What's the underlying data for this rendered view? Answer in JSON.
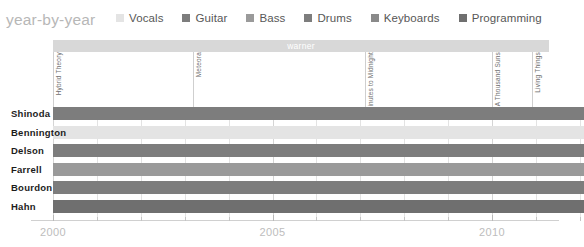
{
  "header": {
    "title": "year-by-year",
    "legend": [
      {
        "label": "Vocals",
        "color": "#e4e4e4"
      },
      {
        "label": "Guitar",
        "color": "#7d7d7d"
      },
      {
        "label": "Bass",
        "color": "#9a9a9a"
      },
      {
        "label": "Drums",
        "color": "#7d7d7d"
      },
      {
        "label": "Keyboards",
        "color": "#8a8a8a"
      },
      {
        "label": "Programming",
        "color": "#6f6f6f"
      }
    ]
  },
  "era": {
    "label": "warner",
    "color": "#d8d8d8",
    "start_year": 2000.0,
    "end_year": 2011.3
  },
  "albums": [
    {
      "label": "Hybrid Theory",
      "year": 2000.0
    },
    {
      "label": "Meteora",
      "year": 2003.2
    },
    {
      "label": "Minutes to Midnight",
      "year": 2007.1
    },
    {
      "label": "A Thousand Suns",
      "year": 2010.0
    },
    {
      "label": "Living Things",
      "year": 2010.9
    }
  ],
  "xaxis": {
    "ticks": [
      {
        "label": "2000",
        "year": 2000,
        "major": true
      },
      {
        "label": "",
        "year": 2001,
        "major": false
      },
      {
        "label": "",
        "year": 2002,
        "major": false
      },
      {
        "label": "",
        "year": 2003,
        "major": false
      },
      {
        "label": "",
        "year": 2004,
        "major": false
      },
      {
        "label": "2005",
        "year": 2005,
        "major": true
      },
      {
        "label": "",
        "year": 2006,
        "major": false
      },
      {
        "label": "",
        "year": 2007,
        "major": false
      },
      {
        "label": "",
        "year": 2008,
        "major": false
      },
      {
        "label": "",
        "year": 2009,
        "major": false
      },
      {
        "label": "2010",
        "year": 2010,
        "major": true
      },
      {
        "label": "",
        "year": 2011,
        "major": false
      },
      {
        "label": "",
        "year": 2012,
        "major": false
      }
    ],
    "min_year": 1999.5,
    "max_year": 2012.1
  },
  "chart_data": {
    "type": "bar",
    "title": "year-by-year",
    "xlabel": "",
    "ylabel": "",
    "xlim": [
      1999.5,
      2012.1
    ],
    "grid": true,
    "legend_position": "top-right",
    "categories": [
      "Shinoda",
      "Bennington",
      "Delson",
      "Farrell",
      "Bourdon",
      "Hahn"
    ],
    "series": [
      {
        "name": "Shinoda",
        "role": "Vocals, Guitar, Keyboards, Programming",
        "bars": [
          {
            "start": 2000.0,
            "end": 2012.1,
            "role": "Guitar",
            "color": "#7d7d7d"
          }
        ]
      },
      {
        "name": "Bennington",
        "role": "Vocals",
        "bars": [
          {
            "start": 2000.0,
            "end": 2012.1,
            "role": "Vocals",
            "color": "#e4e4e4"
          }
        ]
      },
      {
        "name": "Delson",
        "role": "Guitar",
        "bars": [
          {
            "start": 2000.0,
            "end": 2012.1,
            "role": "Guitar",
            "color": "#7d7d7d"
          }
        ]
      },
      {
        "name": "Farrell",
        "role": "Bass",
        "bars": [
          {
            "start": 2000.0,
            "end": 2012.1,
            "role": "Bass",
            "color": "#9a9a9a"
          }
        ]
      },
      {
        "name": "Bourdon",
        "role": "Drums",
        "bars": [
          {
            "start": 2000.0,
            "end": 2012.1,
            "role": "Drums",
            "color": "#7d7d7d"
          }
        ]
      },
      {
        "name": "Hahn",
        "role": "Programming",
        "bars": [
          {
            "start": 2000.0,
            "end": 2012.1,
            "role": "Programming",
            "color": "#6f6f6f"
          }
        ]
      }
    ]
  }
}
